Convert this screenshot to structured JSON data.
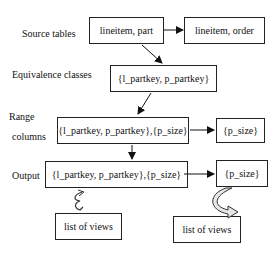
{
  "diagram": {
    "row_labels": {
      "source_tables": "Source tables",
      "equivalence_classes": "Equivalence classes",
      "range_line1": "Range",
      "range_line2": "columns",
      "output": "Output"
    },
    "nodes": {
      "lineitem_part": "lineitem, part",
      "lineitem_order": "lineitem, order",
      "equiv_class": "{l_partkey, p_partkey}",
      "range_main": "{l_partkey, p_partkey},{p_size}",
      "range_side": "{p_size}",
      "output_main": "{l_partkey, p_partkey},{p_size}",
      "output_side": "{p_size}",
      "views_left": "list of views",
      "views_right": "list of views"
    },
    "edges": [
      {
        "from": "lineitem_part",
        "to": "lineitem_order"
      },
      {
        "from": "lineitem_part",
        "to": "equiv_class"
      },
      {
        "from": "equiv_class",
        "to": "range_main"
      },
      {
        "from": "range_main",
        "to": "range_side"
      },
      {
        "from": "range_main",
        "to": "output_main"
      },
      {
        "from": "output_main",
        "to": "output_side"
      },
      {
        "from": "output_main",
        "to": "views_left",
        "style": "curved"
      },
      {
        "from": "output_side",
        "to": "views_right",
        "style": "curved"
      }
    ]
  }
}
